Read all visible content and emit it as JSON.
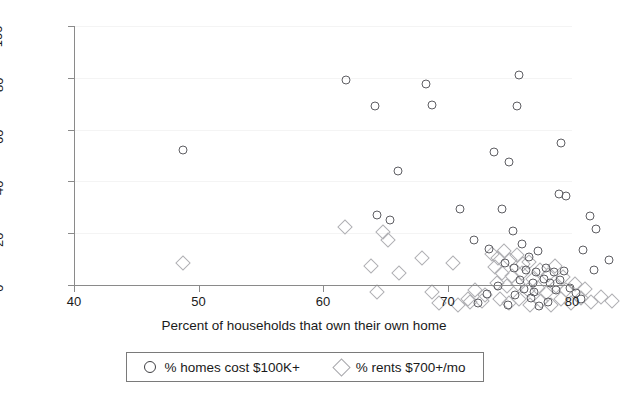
{
  "chart_data": {
    "type": "scatter",
    "title": "",
    "xlabel": "Percent of households that own their own home",
    "ylabel": "",
    "xlim": [
      40,
      80
    ],
    "ylim": [
      0,
      100
    ],
    "xticks": [
      40,
      50,
      60,
      70,
      80
    ],
    "yticks": [
      0,
      20,
      40,
      60,
      80,
      100
    ],
    "grid": true,
    "legend_position": "below-axis",
    "series": [
      {
        "name": "% homes cost $100K+",
        "marker": "circle",
        "color": "#5e5e63",
        "points": [
          [
            42.8,
            62.0
          ],
          [
            55.9,
            89.0
          ],
          [
            58.2,
            79.0
          ],
          [
            62.3,
            87.5
          ],
          [
            62.8,
            79.5
          ],
          [
            69.8,
            91.0
          ],
          [
            69.6,
            79.0
          ],
          [
            60.1,
            54.0
          ],
          [
            67.8,
            61.5
          ],
          [
            73.2,
            65.0
          ],
          [
            69.0,
            57.5
          ],
          [
            58.4,
            37.0
          ],
          [
            59.4,
            35.0
          ],
          [
            65.1,
            39.5
          ],
          [
            68.4,
            39.5
          ],
          [
            73.0,
            45.0
          ],
          [
            73.6,
            44.5
          ],
          [
            75.5,
            36.5
          ],
          [
            76.0,
            31.5
          ],
          [
            69.3,
            31.0
          ],
          [
            66.2,
            27.5
          ],
          [
            67.4,
            24.0
          ],
          [
            70.0,
            26.0
          ],
          [
            71.3,
            23.0
          ],
          [
            70.6,
            21.0
          ],
          [
            74.9,
            23.5
          ],
          [
            77.0,
            19.5
          ],
          [
            75.8,
            16.0
          ],
          [
            68.7,
            18.5
          ],
          [
            69.4,
            16.5
          ],
          [
            70.4,
            16.0
          ],
          [
            71.2,
            15.0
          ],
          [
            72.0,
            16.5
          ],
          [
            72.6,
            15.0
          ],
          [
            73.4,
            15.5
          ],
          [
            71.8,
            12.5
          ],
          [
            70.9,
            11.0
          ],
          [
            69.9,
            12.0
          ],
          [
            72.3,
            11.0
          ],
          [
            73.1,
            12.0
          ],
          [
            70.2,
            8.5
          ],
          [
            71.0,
            7.5
          ],
          [
            72.8,
            8.0
          ],
          [
            69.5,
            6.0
          ],
          [
            70.8,
            5.0
          ],
          [
            68.1,
            9.5
          ],
          [
            67.2,
            6.5
          ],
          [
            73.9,
            9.0
          ],
          [
            74.4,
            7.0
          ],
          [
            66.5,
            3.0
          ],
          [
            72.1,
            3.5
          ],
          [
            71.4,
            2.0
          ],
          [
            74.8,
            4.5
          ],
          [
            68.9,
            2.5
          ]
        ]
      },
      {
        "name": "% rents $700+/mo",
        "marker": "diamond",
        "color": "#b0b0b4",
        "points": [
          [
            42.8,
            18.5
          ],
          [
            55.8,
            32.5
          ],
          [
            58.9,
            30.5
          ],
          [
            59.3,
            27.5
          ],
          [
            57.9,
            17.5
          ],
          [
            60.2,
            14.5
          ],
          [
            58.4,
            7.5
          ],
          [
            62.0,
            20.5
          ],
          [
            62.8,
            7.5
          ],
          [
            64.5,
            18.5
          ],
          [
            65.7,
            4.5
          ],
          [
            66.8,
            4.0
          ],
          [
            67.6,
            22.0
          ],
          [
            68.1,
            20.5
          ],
          [
            68.6,
            23.0
          ],
          [
            69.1,
            19.5
          ],
          [
            69.6,
            21.5
          ],
          [
            70.1,
            18.0
          ],
          [
            70.6,
            19.0
          ],
          [
            67.9,
            17.0
          ],
          [
            68.4,
            14.5
          ],
          [
            69.2,
            13.5
          ],
          [
            70.0,
            14.5
          ],
          [
            70.9,
            12.5
          ],
          [
            71.5,
            16.0
          ],
          [
            72.1,
            14.0
          ],
          [
            72.7,
            17.5
          ],
          [
            73.3,
            13.0
          ],
          [
            68.0,
            11.0
          ],
          [
            68.8,
            9.5
          ],
          [
            69.7,
            10.5
          ],
          [
            70.5,
            8.0
          ],
          [
            71.3,
            9.0
          ],
          [
            72.0,
            7.0
          ],
          [
            72.8,
            9.5
          ],
          [
            73.6,
            8.0
          ],
          [
            74.3,
            10.5
          ],
          [
            75.1,
            8.5
          ],
          [
            66.3,
            8.0
          ],
          [
            67.1,
            6.0
          ],
          [
            68.3,
            4.5
          ],
          [
            69.0,
            3.0
          ],
          [
            69.8,
            4.5
          ],
          [
            70.7,
            2.5
          ],
          [
            71.6,
            4.0
          ],
          [
            72.4,
            2.5
          ],
          [
            73.2,
            4.5
          ],
          [
            74.0,
            3.0
          ],
          [
            74.8,
            5.0
          ],
          [
            75.6,
            3.5
          ],
          [
            76.4,
            5.5
          ],
          [
            77.3,
            4.0
          ],
          [
            64.9,
            2.5
          ],
          [
            65.9,
            3.5
          ],
          [
            63.4,
            3.0
          ]
        ]
      }
    ]
  },
  "axis": {
    "x_tick_labels": [
      "40",
      "50",
      "60",
      "70",
      "80"
    ],
    "y_tick_labels": [
      "0",
      "20",
      "40",
      "60",
      "80",
      "100"
    ],
    "x_title": "Percent of households that own their own home"
  },
  "legend": {
    "entries": [
      {
        "label": "% homes cost $100K+",
        "marker": "circle-icon"
      },
      {
        "label": "% rents $700+/mo",
        "marker": "diamond-icon"
      }
    ]
  }
}
